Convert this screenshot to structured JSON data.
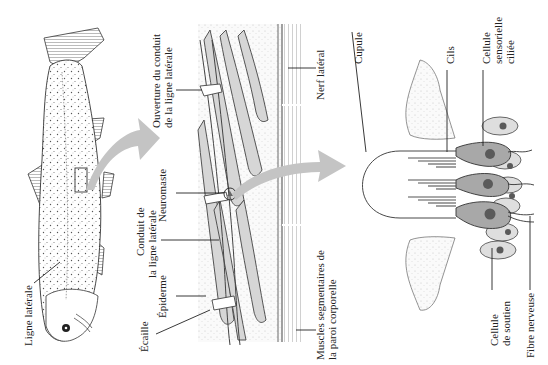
{
  "figure": {
    "language": "fr",
    "orientation": "rotated-90-ccw",
    "colors": {
      "arrow": "#c4c4c4",
      "line": "#333333",
      "tissue_stipple": "#e9e9e9",
      "muscle_band": "#d6d6d6",
      "sensory_cell": "#a8a8a8",
      "support_cell": "#dedede",
      "nucleus": "#5a5a5a"
    },
    "panels": [
      {
        "id": "fish",
        "labels": {
          "lateral_line": "Ligne latérale"
        }
      },
      {
        "id": "cross-section",
        "labels": {
          "canal_opening_l1": "Ouverture du conduit",
          "canal_opening_l2": "de la ligne latérale",
          "neuromast": "Neuromaste",
          "canal_l1": "Conduit de",
          "canal_l2": "la ligne latérale",
          "epidermis": "Épiderme",
          "scale": "Écaille",
          "lateral_nerve": "Nerf latéral",
          "muscles_l1": "Muscles segmentaires de",
          "muscles_l2": "la paroi corporelle"
        }
      },
      {
        "id": "neuromast-detail",
        "labels": {
          "cupula": "Cupule",
          "cilia": "Cils",
          "hair_cell_l1": "Cellule",
          "hair_cell_l2": "sensorielle",
          "hair_cell_l3": "ciliée",
          "support_cell_l1": "Cellule",
          "support_cell_l2": "de soutien",
          "nerve_fiber": "Fibre nerveuse"
        }
      }
    ]
  }
}
